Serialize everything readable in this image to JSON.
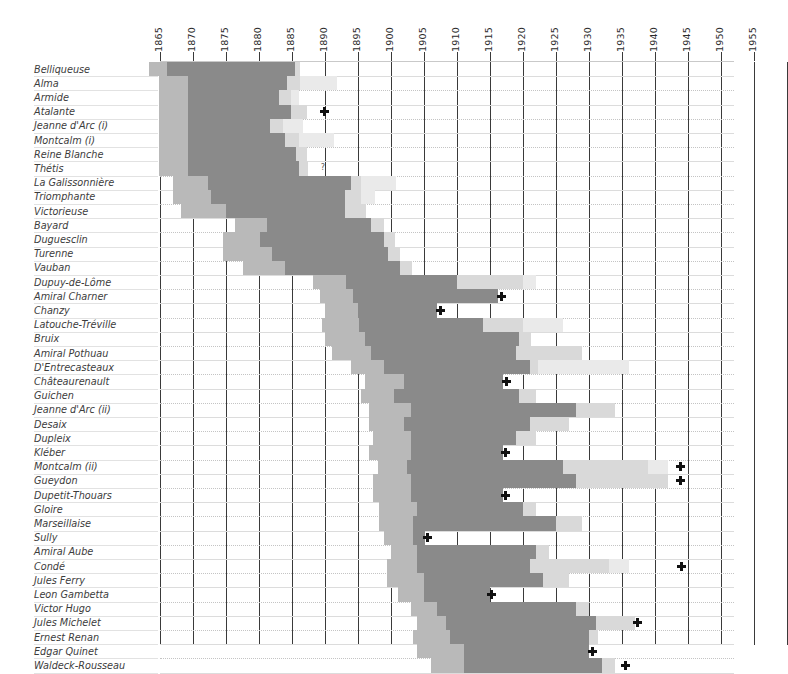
{
  "chart_data": {
    "type": "bar",
    "title": "",
    "subtitle": "",
    "xlabel": "",
    "ylabel": "",
    "orientation": "horizontal-timeline",
    "grid": true,
    "legend_position": "none",
    "xlim": [
      1863,
      1960
    ],
    "axis_ticks": [
      1865,
      1870,
      1875,
      1880,
      1885,
      1890,
      1895,
      1900,
      1905,
      1910,
      1915,
      1920,
      1925,
      1930,
      1935,
      1940,
      1945,
      1950,
      1955
    ],
    "tick_step_years": 5,
    "colors": {
      "build": "#b9b9b9",
      "service": "#8a8a8a",
      "reserve": "#d9d9d9",
      "tail": "#eaeaea",
      "gridline": "#3a3a3a",
      "rowline": "#dcdcdc",
      "marker": "#111111",
      "background": "#ffffff",
      "text": "#3c3c3c"
    },
    "categories": [
      "Belliqueuse",
      "Alma",
      "Armide",
      "Atalante",
      "Jeanne d'Arc (i)",
      "Montcalm (i)",
      "Reine Blanche",
      "Thétis",
      "La Galissonnière",
      "Triomphante",
      "Victorieuse",
      "Bayard",
      "Duguesclin",
      "Turenne",
      "Vauban",
      "Dupuy-de-Lôme",
      "Amiral Charner",
      "Chanzy",
      "Latouche-Tréville",
      "Bruix",
      "Amiral Pothuau",
      "D'Entrecasteaux",
      "Châteaurenault",
      "Guichen",
      "Jeanne d'Arc (ii)",
      "Desaix",
      "Dupleix",
      "Kléber",
      "Montcalm (ii)",
      "Gueydon",
      "Dupetit-Thouars",
      "Gloire",
      "Marseillaise",
      "Sully",
      "Amiral Aube",
      "Condé",
      "Jules Ferry",
      "Leon Gambetta",
      "Victor Hugo",
      "Jules Michelet",
      "Ernest Renan",
      "Edgar Quinet",
      "Waldeck-Rousseau"
    ],
    "rows": [
      {
        "name": "Belliqueuse",
        "build": [
          1863.4,
          1866.0
        ],
        "service": [
          1866.0,
          1885.5
        ],
        "reserve": [
          1885.5,
          1886.2
        ],
        "tail": null,
        "marker": null,
        "query": null
      },
      {
        "name": "Alma",
        "build": [
          1864.8,
          1869.2
        ],
        "service": [
          1869.2,
          1884.2
        ],
        "reserve": [
          1884.2,
          1886.2
        ],
        "tail": [
          1886.2,
          1891.8
        ],
        "marker": null,
        "query": null
      },
      {
        "name": "Armide",
        "build": [
          1864.8,
          1869.2
        ],
        "service": [
          1869.2,
          1883.0
        ],
        "reserve": [
          1883.0,
          1884.8
        ],
        "tail": [
          1884.8,
          1886.0
        ],
        "marker": null,
        "query": null
      },
      {
        "name": "Atalante",
        "build": [
          1864.8,
          1869.2
        ],
        "service": [
          1869.2,
          1884.8
        ],
        "reserve": [
          1884.8,
          1887.2
        ],
        "tail": null,
        "marker": 1889.8,
        "query": null
      },
      {
        "name": "Jeanne d'Arc (i)",
        "build": [
          1864.8,
          1869.2
        ],
        "service": [
          1869.2,
          1881.6
        ],
        "reserve": [
          1881.6,
          1883.6
        ],
        "tail": [
          1883.6,
          1886.6
        ],
        "marker": null,
        "query": null
      },
      {
        "name": "Montcalm (i)",
        "build": [
          1864.8,
          1869.2
        ],
        "service": [
          1869.2,
          1884.0
        ],
        "reserve": [
          1884.0,
          1886.0
        ],
        "tail": [
          1886.0,
          1891.4
        ],
        "marker": null,
        "query": null
      },
      {
        "name": "Reine Blanche",
        "build": [
          1864.8,
          1869.2
        ],
        "service": [
          1869.2,
          1885.6
        ],
        "reserve": [
          1885.6,
          1887.2
        ],
        "tail": null,
        "marker": null,
        "query": null
      },
      {
        "name": "Thétis",
        "build": [
          1864.8,
          1869.2
        ],
        "service": [
          1869.2,
          1886.0
        ],
        "reserve": [
          1886.0,
          1887.4
        ],
        "tail": null,
        "marker": null,
        "query": 1889.8
      },
      {
        "name": "La Galissonnière",
        "build": [
          1867.0,
          1872.2
        ],
        "service": [
          1872.2,
          1894.0
        ],
        "reserve": [
          1894.0,
          1895.4
        ],
        "tail": [
          1895.4,
          1900.8
        ],
        "marker": null,
        "query": null
      },
      {
        "name": "Triomphante",
        "build": [
          1867.0,
          1872.8
        ],
        "service": [
          1872.8,
          1893.0
        ],
        "reserve": [
          1893.0,
          1895.4
        ],
        "tail": [
          1895.4,
          1897.6
        ],
        "marker": null,
        "query": null
      },
      {
        "name": "Victorieuse",
        "build": [
          1868.2,
          1875.0
        ],
        "service": [
          1875.0,
          1893.0
        ],
        "reserve": [
          1893.0,
          1896.2
        ],
        "tail": null,
        "marker": null,
        "query": null
      },
      {
        "name": "Bayard",
        "build": [
          1876.4,
          1881.2
        ],
        "service": [
          1881.2,
          1897.0
        ],
        "reserve": [
          1897.0,
          1899.0
        ],
        "tail": null,
        "marker": null,
        "query": null
      },
      {
        "name": "Duguesclin",
        "build": [
          1874.6,
          1880.2
        ],
        "service": [
          1880.2,
          1899.0
        ],
        "reserve": [
          1899.0,
          1900.6
        ],
        "tail": null,
        "marker": null,
        "query": null
      },
      {
        "name": "Turenne",
        "build": [
          1874.6,
          1882.0
        ],
        "service": [
          1882.0,
          1899.6
        ],
        "reserve": [
          1899.6,
          1901.4
        ],
        "tail": null,
        "marker": null,
        "query": null
      },
      {
        "name": "Vauban",
        "build": [
          1877.6,
          1884.0
        ],
        "service": [
          1884.0,
          1901.4
        ],
        "reserve": [
          1901.4,
          1903.2
        ],
        "tail": null,
        "marker": null,
        "query": null
      },
      {
        "name": "Dupuy-de-Lôme",
        "build": [
          1888.2,
          1893.2
        ],
        "service": [
          1893.2,
          1910.0
        ],
        "reserve": [
          1910.0,
          1920.0
        ],
        "tail": [
          1920.0,
          1922.0
        ],
        "marker": null,
        "query": null
      },
      {
        "name": "Amiral Charner",
        "build": [
          1889.2,
          1894.2
        ],
        "service": [
          1894.2,
          1916.2
        ],
        "reserve": null,
        "tail": null,
        "marker": 1916.6,
        "query": null
      },
      {
        "name": "Chanzy",
        "build": [
          1890.0,
          1895.0
        ],
        "service": [
          1895.0,
          1907.0
        ],
        "reserve": null,
        "tail": null,
        "marker": 1907.4,
        "query": null
      },
      {
        "name": "Latouche-Tréville",
        "build": [
          1889.6,
          1895.2
        ],
        "service": [
          1895.2,
          1914.0
        ],
        "reserve": [
          1914.0,
          1920.0
        ],
        "tail": [
          1920.0,
          1926.0
        ],
        "marker": null,
        "query": null
      },
      {
        "name": "Bruix",
        "build": [
          1890.0,
          1896.0
        ],
        "service": [
          1896.0,
          1919.4
        ],
        "reserve": [
          1919.4,
          1921.2
        ],
        "tail": null,
        "marker": null,
        "query": null
      },
      {
        "name": "Amiral Pothuau",
        "build": [
          1891.0,
          1897.0
        ],
        "service": [
          1897.0,
          1919.0
        ],
        "reserve": [
          1919.0,
          1929.0
        ],
        "tail": null,
        "marker": null,
        "query": null
      },
      {
        "name": "D'Entrecasteaux",
        "build": [
          1894.0,
          1899.0
        ],
        "service": [
          1899.0,
          1921.0
        ],
        "reserve": [
          1921.0,
          1922.2
        ],
        "tail": [
          1922.2,
          1936.0
        ],
        "marker": null,
        "query": null
      },
      {
        "name": "Châteaurenault",
        "build": [
          1896.0,
          1902.0
        ],
        "service": [
          1902.0,
          1917.0
        ],
        "reserve": null,
        "tail": null,
        "marker": 1917.4,
        "query": null
      },
      {
        "name": "Guichen",
        "build": [
          1895.4,
          1900.4
        ],
        "service": [
          1900.4,
          1919.4
        ],
        "reserve": [
          1919.4,
          1922.0
        ],
        "tail": null,
        "marker": null,
        "query": null
      },
      {
        "name": "Jeanne d'Arc (ii)",
        "build": [
          1896.6,
          1903.0
        ],
        "service": [
          1903.0,
          1928.0
        ],
        "reserve": [
          1928.0,
          1934.0
        ],
        "tail": null,
        "marker": null,
        "query": null
      },
      {
        "name": "Desaix",
        "build": [
          1896.6,
          1902.0
        ],
        "service": [
          1902.0,
          1921.0
        ],
        "reserve": [
          1921.0,
          1927.0
        ],
        "tail": null,
        "marker": null,
        "query": null
      },
      {
        "name": "Dupleix",
        "build": [
          1897.2,
          1903.0
        ],
        "service": [
          1903.0,
          1919.0
        ],
        "reserve": [
          1919.0,
          1922.0
        ],
        "tail": null,
        "marker": null,
        "query": null
      },
      {
        "name": "Kléber",
        "build": [
          1896.6,
          1903.0
        ],
        "service": [
          1903.0,
          1917.0
        ],
        "reserve": null,
        "tail": null,
        "marker": 1917.2,
        "query": null
      },
      {
        "name": "Montcalm (ii)",
        "build": [
          1898.0,
          1902.4
        ],
        "service": [
          1902.4,
          1926.0
        ],
        "reserve": [
          1926.0,
          1939.0
        ],
        "tail": [
          1939.0,
          1942.0
        ],
        "marker": 1943.8,
        "query": null
      },
      {
        "name": "Gueydon",
        "build": [
          1897.2,
          1903.0
        ],
        "service": [
          1903.0,
          1928.0
        ],
        "reserve": [
          1928.0,
          1942.0
        ],
        "tail": null,
        "marker": 1943.8,
        "query": null
      },
      {
        "name": "Dupetit-Thouars",
        "build": [
          1897.2,
          1903.0
        ],
        "service": [
          1903.0,
          1917.0
        ],
        "reserve": null,
        "tail": null,
        "marker": 1917.2,
        "query": null
      },
      {
        "name": "Gloire",
        "build": [
          1898.2,
          1904.0
        ],
        "service": [
          1904.0,
          1920.0
        ],
        "reserve": [
          1920.0,
          1922.0
        ],
        "tail": null,
        "marker": null,
        "query": null
      },
      {
        "name": "Marseillaise",
        "build": [
          1898.2,
          1903.4
        ],
        "service": [
          1903.4,
          1925.0
        ],
        "reserve": [
          1925.0,
          1929.0
        ],
        "tail": null,
        "marker": null,
        "query": null
      },
      {
        "name": "Sully",
        "build": [
          1899.0,
          1903.4
        ],
        "service": [
          1903.4,
          1905.2
        ],
        "reserve": null,
        "tail": null,
        "marker": 1905.4,
        "query": null
      },
      {
        "name": "Amiral Aube",
        "build": [
          1900.0,
          1904.0
        ],
        "service": [
          1904.0,
          1922.0
        ],
        "reserve": [
          1922.0,
          1924.0
        ],
        "tail": null,
        "marker": null,
        "query": null
      },
      {
        "name": "Condé",
        "build": [
          1899.4,
          1904.0
        ],
        "service": [
          1904.0,
          1921.0
        ],
        "reserve": [
          1921.0,
          1933.0
        ],
        "tail": [
          1933.0,
          1936.0
        ],
        "marker": 1944.0,
        "query": null
      },
      {
        "name": "Jules Ferry",
        "build": [
          1899.4,
          1905.0
        ],
        "service": [
          1905.0,
          1923.0
        ],
        "reserve": [
          1923.0,
          1927.0
        ],
        "tail": null,
        "marker": null,
        "query": null
      },
      {
        "name": "Leon Gambetta",
        "build": [
          1901.0,
          1905.0
        ],
        "service": [
          1905.0,
          1915.0
        ],
        "reserve": null,
        "tail": null,
        "marker": 1915.2,
        "query": null
      },
      {
        "name": "Victor Hugo",
        "build": [
          1903.0,
          1907.0
        ],
        "service": [
          1907.0,
          1928.0
        ],
        "reserve": [
          1928.0,
          1930.0
        ],
        "tail": null,
        "marker": null,
        "query": null
      },
      {
        "name": "Jules Michelet",
        "build": [
          1904.0,
          1908.4
        ],
        "service": [
          1908.4,
          1931.0
        ],
        "reserve": [
          1931.0,
          1937.0
        ],
        "tail": null,
        "marker": 1937.2,
        "query": null
      },
      {
        "name": "Ernest Renan",
        "build": [
          1903.4,
          1909.0
        ],
        "service": [
          1909.0,
          1930.0
        ],
        "reserve": [
          1930.0,
          1931.4
        ],
        "tail": null,
        "marker": null,
        "query": null
      },
      {
        "name": "Edgar Quinet",
        "build": [
          1904.0,
          1911.0
        ],
        "service": [
          1911.0,
          1930.0
        ],
        "reserve": null,
        "tail": null,
        "marker": 1930.4,
        "query": null
      },
      {
        "name": "Waldeck-Rousseau",
        "build": [
          1906.0,
          1911.0
        ],
        "service": [
          1911.0,
          1932.0
        ],
        "reserve": [
          1932.0,
          1934.0
        ],
        "tail": null,
        "marker": 1935.4,
        "query": null
      }
    ]
  },
  "axis": {
    "years": [
      "1865",
      "1870",
      "1875",
      "1880",
      "1885",
      "1890",
      "1895",
      "1900",
      "1905",
      "1910",
      "1915",
      "1920",
      "1925",
      "1930",
      "1935",
      "1940",
      "1945",
      "1950",
      "1955"
    ]
  }
}
